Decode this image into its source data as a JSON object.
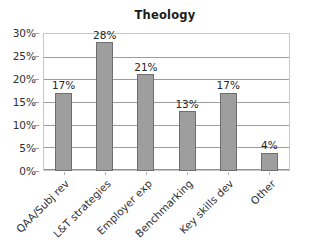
{
  "chart_data": {
    "type": "bar",
    "title": "Theology",
    "xlabel": "",
    "ylabel": "",
    "categories": [
      "QAA/Subj rev",
      "L&T strategies",
      "Employer exp",
      "Benchmarking",
      "Key skills dev",
      "Other"
    ],
    "values": [
      17,
      28,
      21,
      13,
      17,
      4
    ],
    "value_labels": [
      "17%",
      "28%",
      "21%",
      "13%",
      "17%",
      "4%"
    ],
    "ylim": [
      0,
      30
    ],
    "y_ticks": [
      0,
      5,
      10,
      15,
      20,
      25,
      30
    ],
    "y_tick_labels": [
      "0%",
      "5%",
      "10%",
      "15%",
      "20%",
      "25%",
      "30%"
    ],
    "grid": true,
    "legend": false,
    "series": [
      {
        "name": "Theology",
        "values": [
          17,
          28,
          21,
          13,
          17,
          4
        ]
      }
    ],
    "colors": {
      "bar_fill": "#9e9e9e",
      "bar_border": "#6f6f6f",
      "gridline": "#9d9d9d",
      "frame": "#c8c8c8",
      "text": "#2e2e2e",
      "background": "#ffffff"
    }
  }
}
